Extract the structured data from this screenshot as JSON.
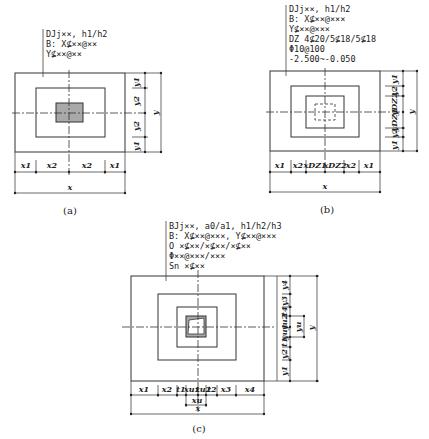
{
  "figure_a": {
    "caption": "(a)",
    "annotation": [
      "DJj××, h1/h2",
      "B: X⊈××@××",
      "   Y⊈××@××"
    ],
    "x_dims": [
      "x1",
      "x2",
      "x2",
      "x1"
    ],
    "x_total": "x",
    "y_dims": [
      "y1",
      "y2",
      "y2",
      "y1"
    ],
    "y_total": "y",
    "column_fill": "#a9a9a9"
  },
  "figure_b": {
    "caption": "(b)",
    "annotation": [
      "DJj××, h1/h2",
      "B: X⊈××@×××",
      "   Y⊈××@×××",
      "DZ 4⊈20/5⊈18/5⊈18",
      "   Φ10@100",
      "   -2.500~-0.050"
    ],
    "x_dims": [
      "x1",
      "x2",
      "xDZ1",
      "xDZ2",
      "x2",
      "x1"
    ],
    "x_total": "x",
    "y_dims": [
      "y1",
      "y2",
      "yDZ1",
      "yDZ2",
      "y2",
      "y1"
    ],
    "y_total": "y"
  },
  "figure_c": {
    "caption": "(c)",
    "annotation": [
      "BJj××, a0/a1, h1/h2/h3",
      "B: X⊈××@×××, Y⊈××@×××",
      "O ×⊈××/×⊈××/×⊈××",
      "  Φ××@×××/×××",
      "Sn ×⊈××"
    ],
    "x_dims": [
      "x1",
      "x2",
      "t1",
      "xu1",
      "xu2",
      "t2",
      "x3",
      "x4"
    ],
    "x_sub": "xu",
    "x_total": "x",
    "y_dims": [
      "y1",
      "y2",
      "t1",
      "yu1",
      "yu2",
      "t4",
      "y3",
      "y4"
    ],
    "y_sub": "yu",
    "y_total": "y",
    "column_fill": "#a9a9a9"
  }
}
